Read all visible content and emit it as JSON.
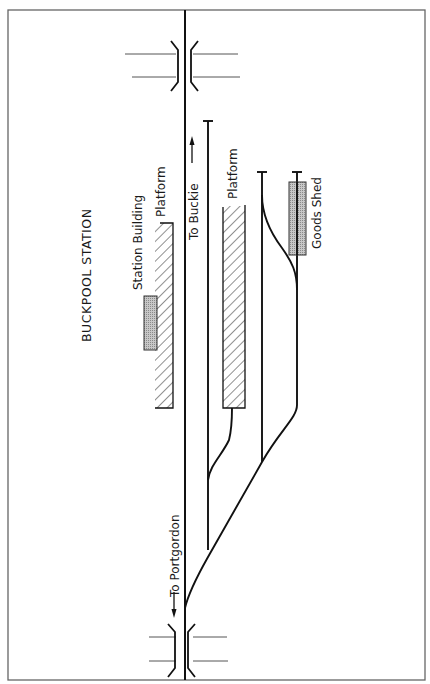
{
  "title": "BUCKPOOL STATION",
  "labels": {
    "station_building": "Station Building",
    "platform_down": "Platform",
    "platform_up": "Platform",
    "goods_shed": "Goods Shed",
    "to_buckie": "To Buckie →",
    "to_portgordon": "← To Portgordon"
  },
  "colors": {
    "line": "#111111",
    "frame": "#555555",
    "building_fill": "#b5b5b5",
    "hatch": "#333333"
  },
  "features": {
    "main_line": "single-track running line (vertical)",
    "sidings": 3,
    "bridges": 2,
    "platforms": 2,
    "buildings": [
      "Station Building",
      "Goods Shed"
    ]
  }
}
